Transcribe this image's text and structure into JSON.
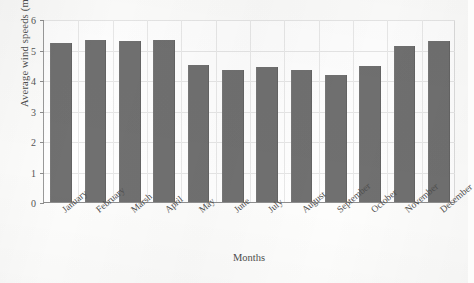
{
  "chart_data": {
    "type": "bar",
    "title": "",
    "xlabel": "Months",
    "ylabel": "Average wind speeds (m/s)",
    "categories": [
      "January",
      "February",
      "Marsh",
      "April",
      "May",
      "June",
      "July",
      "August",
      "September",
      "October",
      "November",
      "December"
    ],
    "values": [
      5.2,
      5.3,
      5.27,
      5.32,
      4.5,
      4.32,
      4.42,
      4.32,
      4.15,
      4.45,
      5.12,
      5.28
    ],
    "series": [
      {
        "name": "Average wind speeds",
        "values": [
          5.2,
          5.3,
          5.27,
          5.32,
          4.5,
          4.32,
          4.42,
          4.32,
          4.15,
          4.45,
          5.12,
          5.28
        ]
      }
    ],
    "ylim": [
      0,
      6
    ],
    "yticks": [
      0,
      1,
      2,
      3,
      4,
      5,
      6
    ],
    "ytick_labels": [
      "0",
      "1",
      "2",
      "3",
      "4",
      "5",
      "6"
    ],
    "grid": true,
    "grid_axis": "y",
    "legend": false,
    "legend_position": "none",
    "bar_color": "#707070",
    "plot_background": "#ffffff",
    "grid_color": "#e6e6e6",
    "axis_color": "#8e8e8e",
    "text_color": "#4e4e4e",
    "xtick_rotation": -40
  }
}
